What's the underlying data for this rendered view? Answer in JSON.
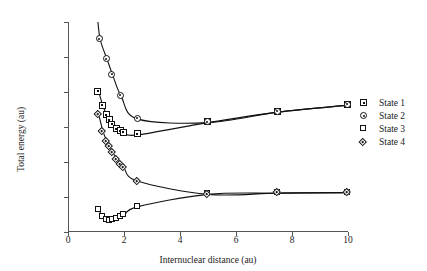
{
  "chart_data": {
    "type": "line",
    "title": "",
    "xlabel": "Internuclear distance (au)",
    "ylabel": "Total energy (au)",
    "xlim": [
      0,
      10
    ],
    "ylim": [
      -1.2,
      0.0
    ],
    "xticks": [
      "0",
      "2",
      "4",
      "6",
      "8",
      "10"
    ],
    "xtick_values": [
      0,
      2,
      4,
      6,
      8,
      10
    ],
    "yticks": [
      "0.0",
      "-0.2",
      "-0.4",
      "-0.6",
      "-0.8",
      "-1.0",
      "-1.2"
    ],
    "ytick_values": [
      0.0,
      -0.2,
      -0.4,
      -0.6,
      -0.8,
      -1.0,
      -1.2
    ],
    "grid": false,
    "legend_position": "right",
    "series": [
      {
        "name": "State 1",
        "marker": "square-dot",
        "x": [
          1.1,
          1.25,
          1.4,
          1.5,
          1.6,
          1.75,
          1.9,
          2.0,
          2.5,
          5.0,
          7.5,
          10.0
        ],
        "y": [
          -0.4,
          -0.48,
          -0.535,
          -0.565,
          -0.59,
          -0.615,
          -0.628,
          -0.635,
          -0.645,
          -0.575,
          -0.515,
          -0.475
        ]
      },
      {
        "name": "State 2",
        "marker": "circle-dot",
        "x": [
          1.05,
          1.15,
          1.4,
          1.6,
          1.9,
          2.5,
          5.0,
          7.5,
          10.0
        ],
        "y": [
          0.03,
          -0.1,
          -0.215,
          -0.305,
          -0.425,
          -0.555,
          -0.575,
          -0.515,
          -0.475
        ]
      },
      {
        "name": "State 3",
        "marker": "square",
        "x": [
          1.1,
          1.25,
          1.4,
          1.5,
          1.6,
          1.75,
          1.9,
          2.0,
          2.5,
          5.0,
          7.5,
          10.0
        ],
        "y": [
          -1.075,
          -1.115,
          -1.133,
          -1.135,
          -1.133,
          -1.125,
          -1.115,
          -1.105,
          -1.055,
          -0.985,
          -0.978,
          -0.975
        ]
      },
      {
        "name": "State 4",
        "marker": "diamond",
        "x": [
          1.1,
          1.25,
          1.4,
          1.5,
          1.6,
          1.75,
          1.9,
          2.0,
          2.5,
          5.0,
          7.5,
          10.0
        ],
        "y": [
          -0.53,
          -0.625,
          -0.685,
          -0.715,
          -0.745,
          -0.785,
          -0.815,
          -0.835,
          -0.91,
          -0.985,
          -0.978,
          -0.975
        ]
      }
    ]
  },
  "legend": {
    "items": [
      {
        "label": "State 1",
        "marker": "square-dot"
      },
      {
        "label": "State 2",
        "marker": "circle-dot"
      },
      {
        "label": "State 3",
        "marker": "square"
      },
      {
        "label": "State 4",
        "marker": "diamond"
      }
    ]
  }
}
